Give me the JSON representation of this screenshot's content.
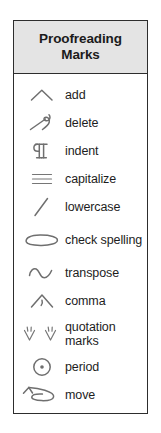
{
  "card": {
    "title": "Proofreading Marks",
    "header_background": "#e4e4e4",
    "border_color": "#2d2d2d",
    "mark_color": "#6f6f6f",
    "text_color": "#1d1d1d"
  },
  "marks": [
    {
      "label": "add",
      "icon": "caret-insert-mark-icon"
    },
    {
      "label": "delete",
      "icon": "delete-loop-mark-icon"
    },
    {
      "label": "indent",
      "icon": "pilcrow-indent-mark-icon"
    },
    {
      "label": "capitalize",
      "icon": "triple-underline-mark-icon"
    },
    {
      "label": "lowercase",
      "icon": "slash-mark-icon"
    },
    {
      "label": "check spelling",
      "icon": "ellipse-circle-mark-icon"
    },
    {
      "label": "transpose",
      "icon": "tilde-wave-mark-icon"
    },
    {
      "label": "comma",
      "icon": "caret-comma-mark-icon"
    },
    {
      "label": "quotation marks",
      "icon": "double-quote-caret-mark-icon"
    },
    {
      "label": "period",
      "icon": "circled-dot-mark-icon"
    },
    {
      "label": "move",
      "icon": "arrow-loop-move-mark-icon"
    }
  ]
}
